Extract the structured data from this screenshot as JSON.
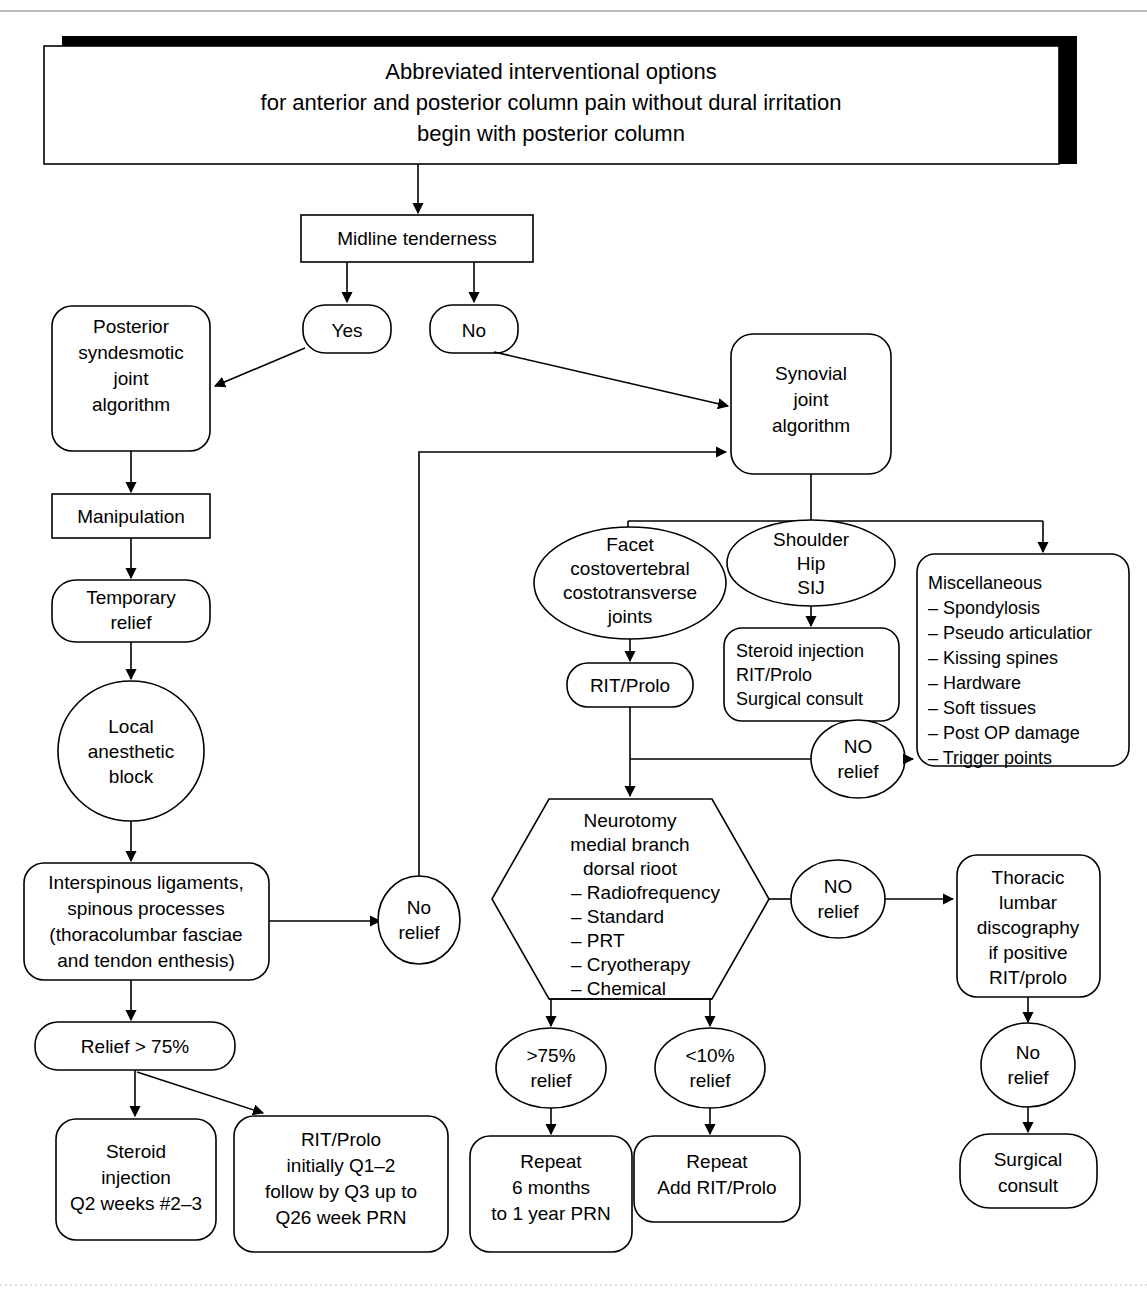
{
  "diagram": {
    "title_lines": [
      "Abbreviated interventional options",
      "for anterior and posterior column pain without dural irritation",
      "begin with posterior column"
    ],
    "nodes": {
      "midline_tenderness": "Midline tenderness",
      "yes": "Yes",
      "no": "No",
      "posterior_syndesmotic": [
        "Posterior",
        "syndesmotic",
        "joint",
        "algorithm"
      ],
      "manipulation": "Manipulation",
      "temporary_relief": [
        "Temporary",
        "relief"
      ],
      "local_anesthetic_block": [
        "Local",
        "anesthetic",
        "block"
      ],
      "interspinous": [
        "Interspinous ligaments,",
        "spinous processes",
        "(thoracolumbar fasciae",
        "and tendon enthesis)"
      ],
      "relief_75": "Relief > 75%",
      "steroid_injection_left": [
        "Steroid",
        "injection",
        "Q2 weeks #2–3"
      ],
      "rit_prolo_schedule": [
        "RIT/Prolo",
        "initially Q1–2",
        "follow by Q3 up to",
        "Q26 week PRN"
      ],
      "no_relief_mid": [
        "No",
        "relief"
      ],
      "synovial_joint": [
        "Synovial",
        "joint",
        "algorithm"
      ],
      "facet_joints": [
        "Facet",
        "costovertebral",
        "costotransverse",
        "joints"
      ],
      "shoulder_hip_sij": [
        "Shoulder",
        "Hip",
        "SIJ"
      ],
      "steroid_injection_right": [
        "Steroid injection",
        "RIT/Prolo",
        "Surgical consult"
      ],
      "miscellaneous": [
        "Miscellaneous",
        "– Spondylosis",
        "– Pseudo articulatior",
        "– Kissing  spines",
        "– Hardware",
        "– Soft tissues",
        "– Post OP damage",
        "– Trigger points"
      ],
      "rit_prolo_small": "RIT/Prolo",
      "no_relief_upper_right": [
        "NO",
        "relief"
      ],
      "neurotomy": [
        "Neurotomy",
        "medial branch",
        "dorsal rioot"
      ],
      "neurotomy_items": [
        "– Radiofrequency",
        "– Standard",
        "– PRT",
        "– Cryotherapy",
        "– Chemical"
      ],
      "no_relief_lower_right": [
        "NO",
        "relief"
      ],
      "relief_gt75": [
        ">75%",
        "relief"
      ],
      "relief_lt10": [
        "<10%",
        "relief"
      ],
      "repeat_6months": [
        "Repeat",
        "6 months",
        "to 1 year PRN"
      ],
      "repeat_add_rit": [
        "Repeat",
        "Add RIT/Prolo"
      ],
      "thoracic_discography": [
        "Thoracic",
        "lumbar",
        "discography",
        "if positive",
        "RIT/prolo"
      ],
      "no_relief_far_right": [
        "No",
        "relief"
      ],
      "surgical_consult": [
        "Surgical",
        "consult"
      ]
    },
    "colors": {
      "stroke": "#000000",
      "fill": "#ffffff",
      "shadow": "#000000",
      "rule": "#a8a8a8"
    }
  }
}
